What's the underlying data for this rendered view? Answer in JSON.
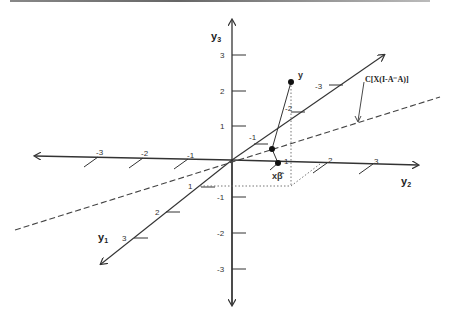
{
  "diagram": {
    "axes": {
      "y1": {
        "label": "y",
        "subscript": "1",
        "ticks": [
          "1",
          "2",
          "3"
        ],
        "neg_ticks": [
          "-1",
          "-2",
          "-3"
        ]
      },
      "y2": {
        "label": "y",
        "subscript": "2",
        "ticks": [
          "1",
          "2",
          "3"
        ],
        "neg_ticks": [
          "-1",
          "-2",
          "-3"
        ]
      },
      "y3": {
        "label": "y",
        "subscript": "3",
        "ticks": [
          "1",
          "2",
          "3"
        ],
        "neg_ticks": [
          "-1",
          "-2",
          "-3"
        ]
      }
    },
    "points": {
      "y": {
        "label": "y"
      },
      "xbeta": {
        "label": "xβ̂"
      }
    },
    "subspace_label": "C[X(I-A⁻A)]",
    "colors": {
      "line": "#333333",
      "dashed": "#444444",
      "dotted": "#666666"
    }
  }
}
